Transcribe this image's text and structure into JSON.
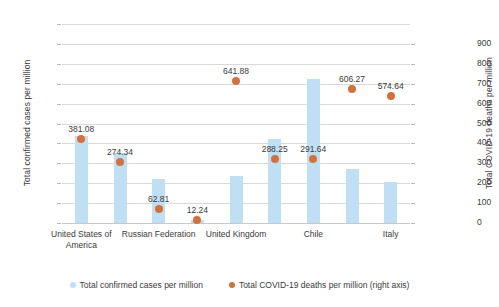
{
  "chart_data": {
    "type": "bar",
    "title": "",
    "xlabel": "",
    "ylabel": "Total confirmed cases per million",
    "ylabel_right": "Total COVID-19 deaths per million",
    "ylim": [
      0,
      20000
    ],
    "ylim_right": [
      0,
      900
    ],
    "grid": true,
    "legend_position": "bottom",
    "categories": [
      "United States of America",
      "",
      "Russian Federation",
      "",
      "United Kingdom",
      "",
      "Chile",
      "",
      "Italy"
    ],
    "tick_labels_left": [
      "20,000",
      "18,000",
      "16,000",
      "14,000",
      "12,000",
      "10,000",
      "8,000",
      "6,000",
      "4,000",
      "2,000",
      "0"
    ],
    "tick_labels_right": [
      "900",
      "800",
      "700",
      "600",
      "500",
      "400",
      "300",
      "200",
      "100",
      "0"
    ],
    "series": [
      {
        "name": "Total confirmed cases per million",
        "axis": "left",
        "color": "#bfdff5",
        "values": [
          8700,
          7000,
          4400,
          350,
          4700,
          8400,
          14500,
          5400,
          4100
        ]
      },
      {
        "name": "Total COVID-19 deaths per million (right axis)",
        "axis": "right",
        "color": "#d4703a",
        "values": [
          381.08,
          274.34,
          62.81,
          12.24,
          641.88,
          288.25,
          291.64,
          606.27,
          574.64
        ],
        "labels": [
          "381.08",
          "274.34",
          "62.81",
          "12.24",
          "641.88",
          "288.25",
          "291.64",
          "606.27",
          "574.64"
        ]
      }
    ]
  },
  "legend": {
    "items": [
      {
        "label": "Total confirmed cases per million",
        "marker": "bar-swatch-icon",
        "color": "#bfdff5"
      },
      {
        "label": "Total COVID-19 deaths per million (right axis)",
        "marker": "dot-marker-icon",
        "color": "#d4703a"
      }
    ]
  }
}
